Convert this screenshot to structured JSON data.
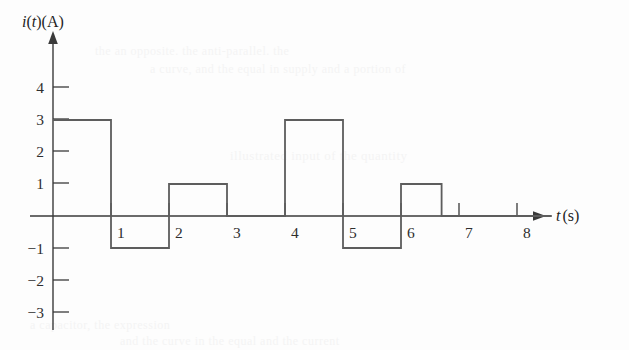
{
  "figure": {
    "name": "current-waveform-plot",
    "background_color": "#fdfdfd",
    "line_color": "#5d5d5d",
    "axis_color": "#3a3a3a"
  },
  "labels": {
    "y_axis_title_i": "i",
    "y_axis_title_paren_t": "(t)",
    "y_axis_title_unit": "(A)",
    "y_axis_title_full": "i(t)(A)",
    "x_axis_title_t": "t",
    "x_axis_title_unit": "(s)",
    "x_axis_title_full": "t (s)"
  },
  "y_ticks": [
    {
      "value": 4,
      "label": "4"
    },
    {
      "value": 3,
      "label": "3"
    },
    {
      "value": 2,
      "label": "2"
    },
    {
      "value": 1,
      "label": "1"
    },
    {
      "value": -1,
      "label": "−1"
    },
    {
      "value": -2,
      "label": "−2"
    },
    {
      "value": -3,
      "label": "−3"
    }
  ],
  "x_ticks": [
    {
      "value": 1,
      "label": "1"
    },
    {
      "value": 2,
      "label": "2"
    },
    {
      "value": 3,
      "label": "3"
    },
    {
      "value": 4,
      "label": "4"
    },
    {
      "value": 5,
      "label": "5"
    },
    {
      "value": 6,
      "label": "6"
    },
    {
      "value": 7,
      "label": "7"
    },
    {
      "value": 8,
      "label": "8"
    }
  ],
  "background_bleed": [
    {
      "text": "the an opposite. the anti-parallel. the",
      "x": 95,
      "y": 44,
      "size": 12
    },
    {
      "text": "a curve, and the equal in supply and a portion of",
      "x": 150,
      "y": 62,
      "size": 12
    },
    {
      "text": "illustrated input of the quantity",
      "x": 230,
      "y": 148,
      "size": 13
    },
    {
      "text": "a capacitor, the expression",
      "x": 30,
      "y": 318,
      "size": 12
    },
    {
      "text": "and the curve in the equal and the current",
      "x": 120,
      "y": 334,
      "size": 12
    }
  ],
  "chart_data": {
    "type": "line",
    "title": "",
    "subtitle": "",
    "xlabel": "t (s)",
    "ylabel": "i(t) (A)",
    "xlim": [
      0,
      8.6
    ],
    "ylim": [
      -3.6,
      4.8
    ],
    "grid": false,
    "legend": null,
    "waveform_style": "piecewise-constant-step",
    "segments": [
      {
        "t_start": 0.0,
        "t_end": 1.0,
        "value": 3
      },
      {
        "t_start": 1.0,
        "t_end": 2.0,
        "value": -1
      },
      {
        "t_start": 2.0,
        "t_end": 3.0,
        "value": 1
      },
      {
        "t_start": 3.0,
        "t_end": 4.0,
        "value": 0
      },
      {
        "t_start": 4.0,
        "t_end": 5.0,
        "value": 3
      },
      {
        "t_start": 5.0,
        "t_end": 6.0,
        "value": -1
      },
      {
        "t_start": 6.0,
        "t_end": 6.7,
        "value": 1
      },
      {
        "t_start": 6.7,
        "t_end": 8.6,
        "value": 0
      }
    ],
    "x": [
      0,
      1,
      1,
      2,
      2,
      3,
      3,
      4,
      4,
      5,
      5,
      6,
      6,
      6.7,
      6.7,
      8.6
    ],
    "y": [
      3,
      3,
      -1,
      -1,
      1,
      1,
      0,
      0,
      3,
      3,
      -1,
      -1,
      1,
      1,
      0,
      0
    ],
    "x_tick_values": [
      1,
      2,
      3,
      4,
      5,
      6,
      7,
      8
    ],
    "y_tick_values": [
      4,
      3,
      2,
      1,
      -1,
      -2,
      -3
    ]
  }
}
